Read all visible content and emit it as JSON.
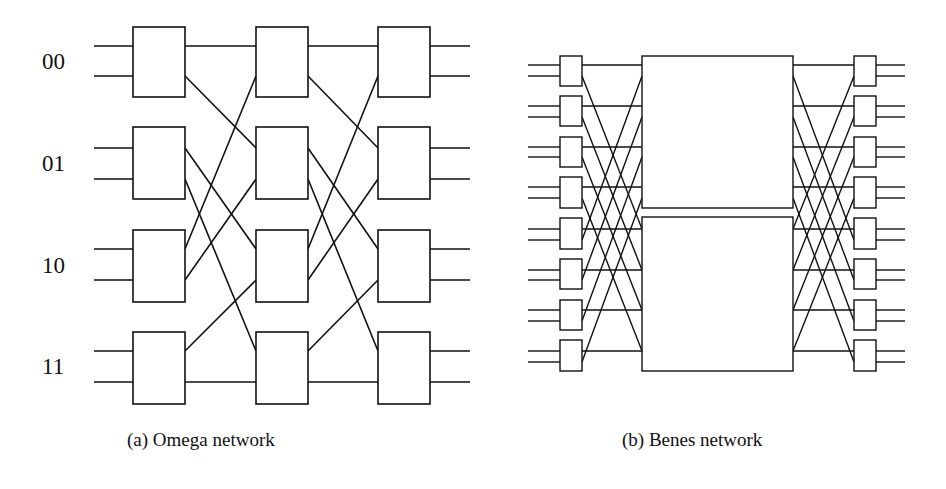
{
  "omega": {
    "title": "Omega network",
    "caption": "(a) Omega network",
    "input_labels": [
      "00",
      "01",
      "10",
      "11"
    ],
    "stages": 3,
    "switches_per_stage": 4
  },
  "benes": {
    "title": "Benes network",
    "caption": "(b) Benes network",
    "outer_switches_per_column": 8,
    "center_subnetworks": 2
  },
  "colors": {
    "line": "#111111",
    "background": "#ffffff"
  }
}
